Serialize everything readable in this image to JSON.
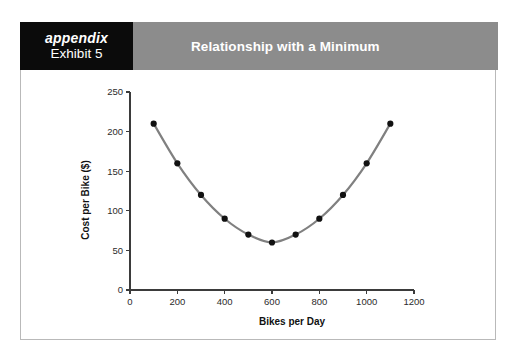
{
  "header": {
    "appendix_label": "appendix",
    "exhibit_label": "Exhibit 5",
    "title": "Relationship with a Minimum",
    "badge_bg": "#0b0b0b",
    "title_bg": "#8c8c8c",
    "title_color": "#ffffff"
  },
  "chart_data": {
    "type": "line",
    "title": "",
    "xlabel": "Bikes per Day",
    "ylabel": "Cost per Bike ($)",
    "x": [
      100,
      200,
      300,
      400,
      500,
      600,
      700,
      800,
      900,
      1000,
      1100
    ],
    "values": [
      210,
      160,
      120,
      90,
      70,
      60,
      70,
      90,
      120,
      160,
      210
    ],
    "series": [
      {
        "name": "Cost per Bike",
        "values": [
          210,
          160,
          120,
          90,
          70,
          60,
          70,
          90,
          120,
          160,
          210
        ]
      }
    ],
    "xlim": [
      0,
      1200
    ],
    "ylim": [
      0,
      250
    ],
    "xticks": [
      0,
      200,
      400,
      600,
      800,
      1000,
      1200
    ],
    "yticks": [
      0,
      50,
      100,
      150,
      200,
      250
    ],
    "xtick_labels": [
      "0",
      "200",
      "400",
      "600",
      "800",
      "1000",
      "1200"
    ],
    "ytick_labels": [
      "0",
      "50",
      "100",
      "150",
      "200",
      "250"
    ],
    "grid": false,
    "legend": false,
    "line_color": "#808080",
    "marker_color": "#111111",
    "marker_shape": "circle",
    "minimum": {
      "x": 600,
      "y": 60
    }
  }
}
